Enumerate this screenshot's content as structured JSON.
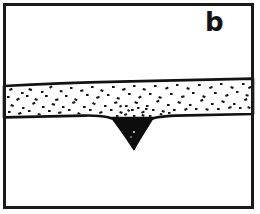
{
  "figure": {
    "panel_label": "b",
    "type": "geological-cross-section",
    "colors": {
      "background": "#ffffff",
      "ink": "#111111",
      "frame": "#1a1a1a",
      "wedge_fill": "#0d0d0d",
      "stipple": "#141414"
    },
    "frame": {
      "x": 3,
      "y": 3,
      "width": 250,
      "height": 205,
      "stroke_width": 3
    },
    "layers": [
      {
        "name": "upper-blank-unit",
        "label": "",
        "fill": "none",
        "description": "blank white unit above the stippled bed"
      },
      {
        "name": "stippled-sand-bed",
        "label": "",
        "fill": "stipple",
        "description": "sand/gravel bed with dash-and-dot stipple ornament, thins and rises gently to the right",
        "top_left_y": 85,
        "top_right_y": 79,
        "base_left_y": 119,
        "base_right_y": 115
      },
      {
        "name": "lower-blank-unit",
        "label": "",
        "fill": "none",
        "description": "blank white substrate below the bed"
      }
    ],
    "wedge": {
      "name": "ice-wedge-cast",
      "label": "",
      "fill": "solid-black",
      "top_left_x": 112,
      "top_right_x": 153,
      "top_y": 118,
      "apex_x": 133,
      "apex_y": 150,
      "description": "downward-tapering solid black wedge cutting the base of the stippled bed"
    },
    "trough": {
      "name": "bed-base-downwarp",
      "left_x": 108,
      "right_x": 172,
      "description": "base of the stippled bed sags into the wedge"
    }
  }
}
